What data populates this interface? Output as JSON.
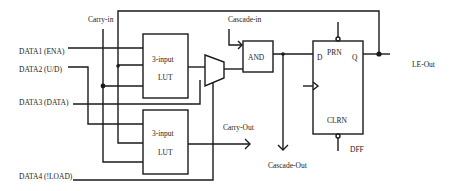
{
  "diagram": {
    "type": "logic-element-schematic",
    "inputs": [
      {
        "label": "DATA1 (ENA)"
      },
      {
        "label": "DATA2 (U/D)"
      },
      {
        "label": "DATA3 (DATA)"
      },
      {
        "label": "DATA4 (!LOAD)"
      }
    ],
    "signals": {
      "carry_in": "Carry-in",
      "cascade_in": "Cascade-in",
      "carry_out": "Carry-Out",
      "cascade_out": "Cascade-Out",
      "le_out": "LE-Out"
    },
    "blocks": {
      "lut_top": {
        "line1": "3-input",
        "line2": "LUT"
      },
      "lut_bottom": {
        "line1": "3-input",
        "line2": "LUT"
      },
      "and_gate": {
        "label": "AND"
      },
      "dff": {
        "label": "DFF",
        "d": "D",
        "q": "Q",
        "prn": "PRN",
        "clrn": "CLRN"
      }
    },
    "colors": {
      "line": "#1a1a1a",
      "background": "#ffffff"
    }
  }
}
